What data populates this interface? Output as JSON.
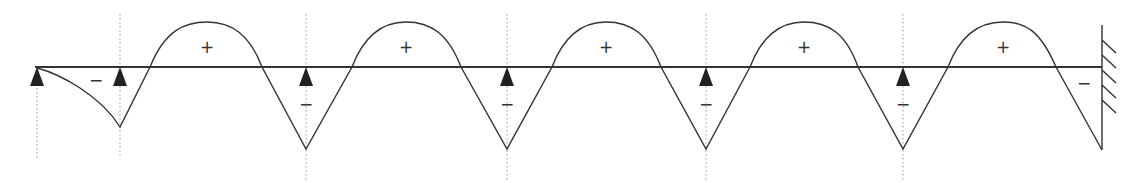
{
  "diagram": {
    "beam_y": 67,
    "colors": {
      "line": "#333333",
      "guide": "#888888",
      "background": "#ffffff"
    },
    "supports": [
      {
        "type": "pin",
        "x": 37
      },
      {
        "type": "pin",
        "x": 120
      },
      {
        "type": "pin",
        "x": 306
      },
      {
        "type": "pin",
        "x": 507
      },
      {
        "type": "pin",
        "x": 706
      },
      {
        "type": "pin",
        "x": 903
      },
      {
        "type": "fixed",
        "x": 1102
      }
    ],
    "guides_x": [
      37,
      120,
      306,
      507,
      706,
      903
    ],
    "positive_labels": [
      {
        "text": "+",
        "x": 207,
        "y": 48
      },
      {
        "text": "+",
        "x": 406,
        "y": 48
      },
      {
        "text": "+",
        "x": 606,
        "y": 48
      },
      {
        "text": "+",
        "x": 804,
        "y": 48
      },
      {
        "text": "+",
        "x": 1003,
        "y": 48
      }
    ],
    "negative_labels": [
      {
        "text": "−",
        "x": 96,
        "y": 81
      },
      {
        "text": "−",
        "x": 306,
        "y": 105
      },
      {
        "text": "−",
        "x": 507,
        "y": 105
      },
      {
        "text": "−",
        "x": 706,
        "y": 105
      },
      {
        "text": "−",
        "x": 903,
        "y": 105
      },
      {
        "text": "−",
        "x": 1084,
        "y": 84
      }
    ]
  }
}
